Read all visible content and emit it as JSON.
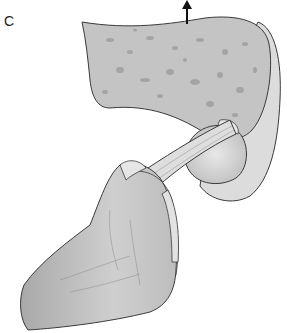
{
  "figure": {
    "panel_label": "C",
    "colors": {
      "bone_fill": "#c9c9c9",
      "bone_dark": "#9c9c9c",
      "outline": "#3a3a3a",
      "light": "#e4e4e4",
      "background": "#ffffff"
    },
    "icons": [
      "arrow-up-icon"
    ]
  }
}
